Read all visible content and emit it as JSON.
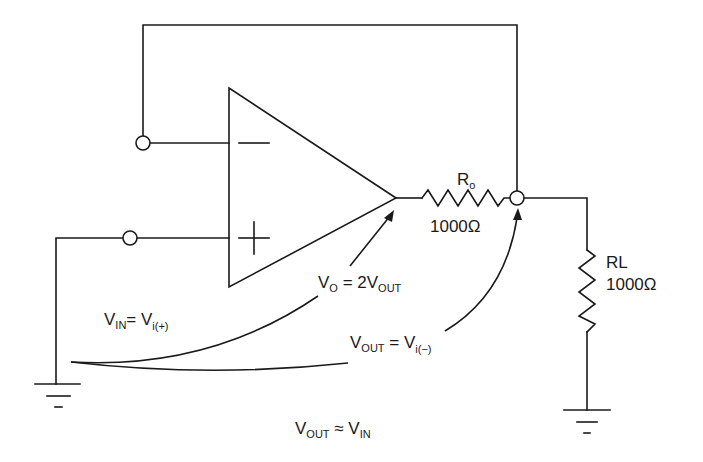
{
  "diagram": {
    "title": "",
    "colors": {
      "ink": "#1a1a1a",
      "background": "#ffffff"
    },
    "opamp": {
      "inverting_symbol": "−",
      "noninverting_symbol": "+"
    },
    "resistor_output": {
      "name_main": "R",
      "name_sub": "o",
      "value": "1000Ω"
    },
    "resistor_load": {
      "name": "RL",
      "value": "1000Ω"
    },
    "labels": {
      "vo_main": "V",
      "vo_sub": "O",
      "vo_eq": " = 2V",
      "vo_eq_sub": "OUT",
      "vin_main": "V",
      "vin_sub": "IN",
      "vin_eq": "= V",
      "vin_eq_sub": "i(+)",
      "vout_main": "V",
      "vout_sub": "OUT",
      "vout_eq": " = V",
      "vout_eq_sub": "i(−)",
      "result_main": "V",
      "result_sub": "OUT",
      "result_eq": " ≈ V",
      "result_eq_sub": "IN"
    }
  }
}
